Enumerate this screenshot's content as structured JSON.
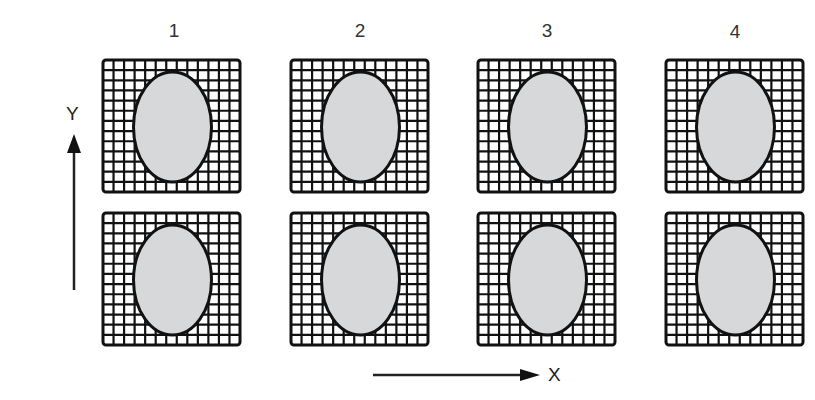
{
  "diagram": {
    "columns": [
      {
        "label": "1",
        "x": 103
      },
      {
        "label": "2",
        "x": 291
      },
      {
        "label": "3",
        "x": 478
      },
      {
        "label": "4",
        "x": 666
      }
    ],
    "rows": [
      {
        "y": 60
      },
      {
        "y": 213
      }
    ],
    "cell": {
      "width": 137,
      "height": 132,
      "grid_divisions": 13
    },
    "ellipse": {
      "rx": 39,
      "ry": 55,
      "fill": "#d6d8da",
      "stroke": "#111111"
    },
    "grid_color": "#111111",
    "axes": {
      "y_label": "Y",
      "x_label": "X"
    }
  }
}
